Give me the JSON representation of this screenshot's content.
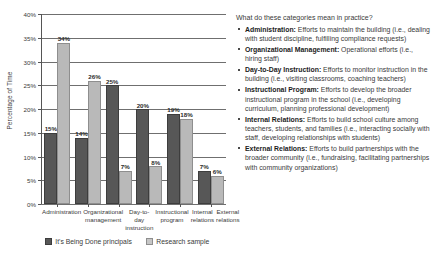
{
  "chart_data": {
    "type": "bar",
    "title": "",
    "xlabel": "",
    "ylabel": "Percentage of Time",
    "ylim": [
      0,
      40
    ],
    "ytick_labels": [
      "0%",
      "5%",
      "10%",
      "15%",
      "20%",
      "25%",
      "30%",
      "35%",
      "40%"
    ],
    "ytick_values": [
      0,
      5,
      10,
      15,
      20,
      25,
      30,
      35,
      40
    ],
    "grid": true,
    "legend_position": "bottom",
    "categories": [
      "Administration",
      "Organizational management",
      "Day-to-day instruction",
      "Instructional program",
      "Internal relations",
      "External relations"
    ],
    "series": [
      {
        "name": "It's Being Done principals",
        "color": "#575757",
        "values": [
          15,
          14,
          25,
          20,
          19,
          7
        ],
        "value_labels": [
          "15%",
          "14%",
          "25%",
          "20%",
          "19%",
          "7%"
        ]
      },
      {
        "name": "Research sample",
        "color": "#b9b9b9",
        "values": [
          34,
          26,
          7,
          8,
          18,
          6
        ],
        "value_labels": [
          "34%",
          "26%",
          "7%",
          "8%",
          "18%",
          "6%"
        ]
      }
    ]
  },
  "side_panel": {
    "title": "What do these categories mean in practice?",
    "items": [
      {
        "term": "Administration:",
        "text": " Efforts to maintain the building (i.e., dealing with student discipline, fulfilling compliance requests)"
      },
      {
        "term": "Organizational Management:",
        "text": " Operational efforts (i.e., hiring staff)"
      },
      {
        "term": "Day-to-Day Instruction:",
        "text": "  Efforts to monitor instruction in the building (i.e., visiting classrooms, coaching teachers)"
      },
      {
        "term": "Instructional Program:",
        "text": " Efforts to develop the broader instructional program in the school (i.e., developing curriculum, planning professional development)"
      },
      {
        "term": "Internal Relations:",
        "text": " Efforts to build school culture among teachers, students, and families (i.e., interacting socially with staff, developing relationships with students)"
      },
      {
        "term": "External Relations:",
        "text": " Efforts to build partnerships with the broader community (i.e., fundraising, facilitating partnerships with community organizations)"
      }
    ]
  }
}
